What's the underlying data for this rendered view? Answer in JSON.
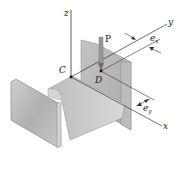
{
  "diagram": {
    "labels": {
      "z_axis": "z",
      "y_axis": "y",
      "x_axis": "x",
      "centroid": "C",
      "load_point": "D",
      "load": "P",
      "ex_base": "e",
      "ex_sub": "x",
      "ey_base": "e",
      "ey_sub": "y"
    },
    "colors": {
      "line": "#333333",
      "steel_light": "#d8d8d8",
      "steel_mid": "#bdbdbd",
      "steel_dark": "#9a9a9a",
      "background": "#ffffff"
    }
  }
}
